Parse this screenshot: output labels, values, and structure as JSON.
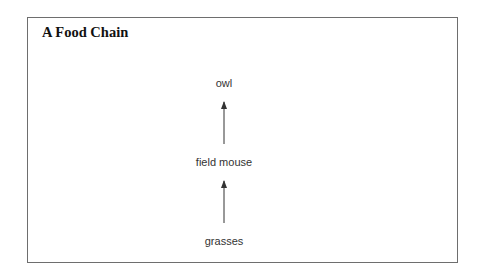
{
  "diagram": {
    "title": "A Food Chain",
    "nodes": [
      {
        "id": "owl",
        "label": "owl"
      },
      {
        "id": "field-mouse",
        "label": "field mouse"
      },
      {
        "id": "grasses",
        "label": "grasses"
      }
    ],
    "edges": [
      {
        "from": "grasses",
        "to": "field-mouse"
      },
      {
        "from": "field-mouse",
        "to": "owl"
      }
    ],
    "colors": {
      "border": "#6e6e6e",
      "arrow": "#333333",
      "text": "#333333"
    }
  }
}
